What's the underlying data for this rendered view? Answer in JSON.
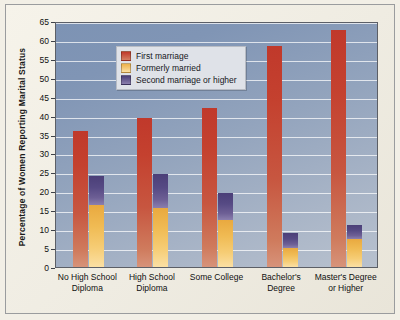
{
  "chart_data": {
    "type": "bar",
    "title": "",
    "xlabel": "",
    "ylabel": "Percentage of Women Reporting Marital Status",
    "ylim": [
      0,
      65
    ],
    "ytick_step": 5,
    "yticks": [
      0,
      5,
      10,
      15,
      20,
      25,
      30,
      35,
      40,
      45,
      50,
      55,
      60,
      65
    ],
    "grid": true,
    "legend_position": "top-left",
    "stacked_note": "Second series column is a stacked bar: 'Formerly married' at bottom, 'Second marriage or higher' stacked above it.",
    "categories": [
      "No High School Diploma",
      "High School Diploma",
      "Some College",
      "Bachelor's Degree",
      "Master's Degree or Higher"
    ],
    "series": [
      {
        "name": "First marriage",
        "color": "#c0392b",
        "values": [
          36,
          39.5,
          42,
          58.5,
          62.5
        ]
      },
      {
        "name": "Formerly married",
        "color": "#edb14a",
        "values": [
          16.5,
          15.5,
          12.5,
          5,
          7.5
        ]
      },
      {
        "name": "Second marriage or higher",
        "color": "#4b3f78",
        "values": [
          7.5,
          9,
          7,
          4,
          3.5
        ]
      }
    ],
    "stack_tops": [
      24,
      24.5,
      19.5,
      9,
      11
    ]
  },
  "legend": {
    "items": [
      {
        "label": "First marriage"
      },
      {
        "label": "Formerly married"
      },
      {
        "label": "Second marriage or higher"
      }
    ]
  },
  "axis": {
    "y_title": "Percentage of Women Reporting Marital Status",
    "y_labels": [
      "65",
      "60",
      "55",
      "50",
      "45",
      "40",
      "35",
      "30",
      "25",
      "20",
      "15",
      "10",
      "5",
      "0"
    ],
    "x_labels": [
      {
        "line1": "No High School",
        "line2": "Diploma"
      },
      {
        "line1": "High School",
        "line2": "Diploma"
      },
      {
        "line1": "Some College",
        "line2": ""
      },
      {
        "line1": "Bachelor's",
        "line2": "Degree"
      },
      {
        "line1": "Master's Degree",
        "line2": "or Higher"
      }
    ]
  },
  "colors": {
    "first_marriage": "#c0392b",
    "formerly_married": "#edb14a",
    "second_marriage": "#4b3f78",
    "plot_background": "#93a4bd",
    "page_background": "#f2efe6"
  }
}
